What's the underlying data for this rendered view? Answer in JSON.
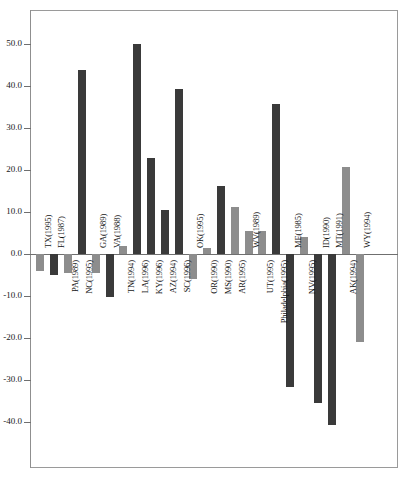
{
  "chart_data": {
    "type": "bar",
    "title": "",
    "subtitle": "",
    "xlabel": "",
    "ylabel": "",
    "ylim": [
      -45,
      55
    ],
    "grid": false,
    "legend": "none",
    "axis": {
      "y_ticks": [
        "50.0",
        "40.0",
        "30.0",
        "20.0",
        "10.0",
        "0.0",
        "-10.0",
        "-20.0",
        "-30.0",
        "-40.0"
      ],
      "y_tick_values": [
        50,
        40,
        30,
        20,
        10,
        0,
        -10,
        -20,
        -30,
        -40
      ]
    },
    "colors": {
      "light_bar": "#8d8d8d",
      "dark_bar": "#3a3a3a",
      "axis": "#6f6f6f",
      "frame": "#9a9a9a",
      "text": "#141414"
    },
    "categories": [
      "TX(1995)",
      "FL(1987)",
      "PA(1989)",
      "NC(1995)",
      "GA(1989)",
      "VA(1988)",
      "TN(1994)",
      "LA(1996)",
      "KY(1996)",
      "AZ(1994)",
      "SC(1996)",
      "OK(1995)",
      "OR(1990)",
      "MS(1990)",
      "AR(1995)",
      "WV(1989)",
      "UT(1995)",
      "Philadelphia(1995)",
      "ME(1985)",
      "NV(1995)",
      "ID(1990)",
      "MT(1991)",
      "AK(1994)",
      "WY(1994)"
    ],
    "values": [
      -4.0,
      -5.0,
      -4.5,
      43.6,
      -4.5,
      -10.2,
      1.8,
      49.8,
      22.7,
      10.4,
      39.3,
      -6.0,
      1.5,
      16.2,
      11.2,
      5.5,
      5.5,
      35.6,
      -31.5,
      4.0,
      -35.5,
      -40.5,
      20.6,
      -21.0
    ],
    "shades": [
      "light",
      "dark",
      "light",
      "dark",
      "light",
      "dark",
      "light",
      "dark",
      "dark",
      "dark",
      "dark",
      "light",
      "light",
      "dark",
      "light",
      "light",
      "light",
      "dark",
      "dark",
      "light",
      "dark",
      "dark",
      "light",
      "light"
    ],
    "bar_label_side": [
      "above",
      "above",
      "below",
      "below",
      "above",
      "above",
      "below",
      "below",
      "below",
      "below",
      "below",
      "above",
      "below",
      "below",
      "below",
      "above",
      "below",
      "below",
      "above",
      "below",
      "above",
      "above",
      "below",
      "above"
    ]
  }
}
